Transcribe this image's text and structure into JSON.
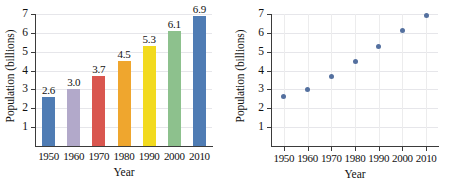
{
  "chart_data": [
    {
      "type": "bar",
      "title": "",
      "xlabel": "Year",
      "ylabel": "Population (billions)",
      "categories": [
        "1950",
        "1960",
        "1970",
        "1980",
        "1990",
        "2000",
        "2010"
      ],
      "values": [
        2.6,
        3.0,
        3.7,
        4.5,
        5.3,
        6.1,
        6.9
      ],
      "value_labels": [
        "2.6",
        "3.0",
        "3.7",
        "4.5",
        "5.3",
        "6.1",
        "6.9"
      ],
      "ylim": [
        0,
        7
      ],
      "ytick_labels": [
        "1",
        "2",
        "3",
        "4",
        "5",
        "6",
        "7"
      ],
      "yticks": [
        1,
        2,
        3,
        4,
        5,
        6,
        7
      ],
      "bar_colors": [
        "#4f7cb4",
        "#b2a9ca",
        "#d9564f",
        "#efa62e",
        "#f2da1e",
        "#8dc18d",
        "#4f7cb4"
      ],
      "grid": true,
      "legend": "none"
    },
    {
      "type": "scatter",
      "title": "",
      "xlabel": "Year",
      "ylabel": "Population (billions)",
      "x": [
        1950,
        1960,
        1970,
        1980,
        1990,
        2000,
        2010
      ],
      "y": [
        2.6,
        3.0,
        3.7,
        4.5,
        5.3,
        6.1,
        6.9
      ],
      "xtick_labels": [
        "1950",
        "1960",
        "1970",
        "1980",
        "1990",
        "2000",
        "2010"
      ],
      "ytick_labels": [
        "1",
        "2",
        "3",
        "4",
        "5",
        "6",
        "7"
      ],
      "yticks": [
        1,
        2,
        3,
        4,
        5,
        6,
        7
      ],
      "xlim": [
        1945,
        2015
      ],
      "ylim": [
        0,
        7
      ],
      "marker_color": "#54709f",
      "grid": true,
      "legend": "none"
    }
  ],
  "colors": {
    "axis": "#3b3b3b",
    "grid": "#e6e6ea",
    "marker": "#54709f",
    "background": "#ffffff"
  }
}
